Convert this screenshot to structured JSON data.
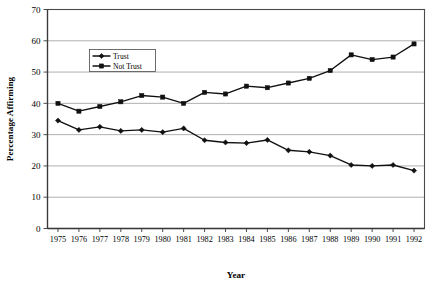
{
  "chart_data": {
    "type": "line",
    "title": "",
    "xlabel": "Year",
    "ylabel": "Percentage Affirming",
    "categories": [
      "1975",
      "1976",
      "1977",
      "1978",
      "1979",
      "1980",
      "1981",
      "1982",
      "1983",
      "1984",
      "1985",
      "1986",
      "1987",
      "1988",
      "1989",
      "1990",
      "1991",
      "1992"
    ],
    "x": [
      1975,
      1976,
      1977,
      1978,
      1979,
      1980,
      1981,
      1982,
      1983,
      1984,
      1985,
      1986,
      1987,
      1988,
      1989,
      1990,
      1991,
      1992
    ],
    "series": [
      {
        "name": "Trust",
        "marker": "diamond",
        "color": "#111111",
        "values": [
          34.5,
          31.5,
          32.5,
          31.2,
          31.5,
          30.8,
          32.0,
          28.2,
          27.5,
          27.3,
          28.3,
          25.0,
          24.5,
          23.3,
          20.3,
          20.0,
          20.3,
          18.5
        ]
      },
      {
        "name": "Not Trust",
        "marker": "square",
        "color": "#111111",
        "values": [
          40.0,
          37.5,
          39.0,
          40.5,
          42.5,
          42.0,
          40.0,
          43.5,
          43.0,
          45.5,
          45.0,
          46.5,
          48.0,
          50.5,
          55.5,
          54.0,
          54.8,
          59.0
        ]
      }
    ],
    "ylim": [
      0,
      70
    ],
    "yticks": [
      0,
      10,
      20,
      30,
      40,
      50,
      60,
      70
    ],
    "ytick_labels": [
      "0",
      "10",
      "20",
      "30",
      "40",
      "50",
      "60",
      "70"
    ],
    "grid": true,
    "grid_axis": "y",
    "legend_position": "upper-left-inside",
    "legend_entries": [
      "Trust",
      "Not Trust"
    ]
  }
}
